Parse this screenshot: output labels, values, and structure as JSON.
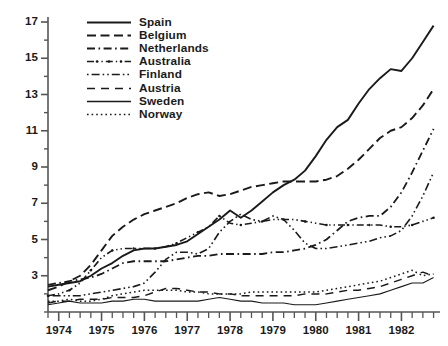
{
  "chart_data": {
    "type": "line",
    "title": "",
    "xlabel": "",
    "ylabel": "",
    "xlim": [
      1973.75,
      1982.9
    ],
    "ylim": [
      1,
      17
    ],
    "yticks_major": [
      3,
      5,
      7,
      9,
      11,
      13,
      15,
      17
    ],
    "yticks_minor": [
      1,
      2,
      4,
      6,
      8,
      10,
      12,
      14,
      16
    ],
    "xticks_major": [
      1974,
      1975,
      1976,
      1977,
      1978,
      1979,
      1980,
      1981,
      1982
    ],
    "xtick_labels": [
      "1974",
      "1975",
      "1976",
      "1977",
      "1978",
      "1979",
      "1980",
      "1981",
      "1982"
    ],
    "xtick_minor_step": 0.25,
    "grid": false,
    "legend_position": "top-left",
    "x": [
      1973.75,
      1974.0,
      1974.25,
      1974.5,
      1974.75,
      1975.0,
      1975.25,
      1975.5,
      1975.75,
      1976.0,
      1976.25,
      1976.5,
      1976.75,
      1977.0,
      1977.25,
      1977.5,
      1977.75,
      1978.0,
      1978.25,
      1978.5,
      1978.75,
      1979.0,
      1979.25,
      1979.5,
      1979.75,
      1980.0,
      1980.25,
      1980.5,
      1980.75,
      1981.0,
      1981.25,
      1981.5,
      1981.75,
      1982.0,
      1982.25,
      1982.5,
      1982.75
    ],
    "series": [
      {
        "name": "Spain",
        "style": "solid",
        "width": 1.9,
        "markers": false,
        "values": [
          2.4,
          2.5,
          2.6,
          2.7,
          3.0,
          3.4,
          3.7,
          4.1,
          4.4,
          4.5,
          4.5,
          4.6,
          4.7,
          4.9,
          5.3,
          5.7,
          6.1,
          6.6,
          6.2,
          6.6,
          7.1,
          7.6,
          8.0,
          8.3,
          8.8,
          9.6,
          10.5,
          11.2,
          11.6,
          12.5,
          13.3,
          13.9,
          14.4,
          14.3,
          15.0,
          15.9,
          16.8
        ]
      },
      {
        "name": "Belgium",
        "style": "dashed",
        "width": 1.9,
        "markers": false,
        "values": [
          2.2,
          2.4,
          2.7,
          3.0,
          3.6,
          4.4,
          5.2,
          5.7,
          6.1,
          6.4,
          6.6,
          6.8,
          7.0,
          7.3,
          7.5,
          7.6,
          7.4,
          7.5,
          7.7,
          7.9,
          8.0,
          8.1,
          8.2,
          8.2,
          8.2,
          8.2,
          8.3,
          8.5,
          8.9,
          9.4,
          10.0,
          10.6,
          11.0,
          11.2,
          11.7,
          12.4,
          13.3
        ]
      },
      {
        "name": "Netherlands",
        "style": "dashdot",
        "width": 1.8,
        "markers": false,
        "values": [
          2.5,
          2.6,
          2.7,
          2.8,
          2.9,
          3.1,
          3.4,
          3.7,
          3.8,
          3.8,
          3.8,
          3.8,
          3.9,
          4.0,
          4.1,
          4.1,
          4.2,
          4.2,
          4.2,
          4.2,
          4.2,
          4.3,
          4.3,
          4.4,
          4.5,
          4.7,
          5.0,
          5.5,
          6.0,
          6.2,
          6.3,
          6.3,
          6.8,
          7.6,
          8.7,
          9.9,
          11.1
        ]
      },
      {
        "name": "Australia",
        "style": "dashdotdot",
        "width": 1.6,
        "markers": true,
        "values": [
          1.9,
          2.0,
          2.2,
          2.6,
          3.3,
          4.0,
          4.4,
          4.5,
          4.5,
          4.5,
          4.5,
          4.6,
          4.8,
          5.1,
          5.4,
          5.7,
          6.3,
          5.9,
          5.8,
          5.9,
          6.0,
          6.1,
          6.1,
          6.1,
          6.0,
          5.9,
          5.8,
          5.8,
          5.8,
          5.8,
          5.8,
          5.8,
          5.7,
          5.7,
          5.8,
          6.0,
          6.2
        ]
      },
      {
        "name": "Finland",
        "style": "dotdash",
        "width": 1.6,
        "markers": false,
        "values": [
          1.9,
          1.9,
          1.9,
          1.9,
          2.0,
          2.1,
          2.2,
          2.3,
          2.4,
          2.6,
          3.2,
          3.9,
          4.3,
          4.3,
          4.2,
          4.5,
          5.4,
          6.0,
          6.4,
          6.1,
          6.0,
          6.3,
          6.1,
          5.5,
          4.8,
          4.5,
          4.5,
          4.6,
          4.7,
          4.8,
          4.9,
          5.1,
          5.2,
          5.5,
          6.3,
          7.4,
          8.7
        ]
      },
      {
        "name": "Austria",
        "style": "longdash",
        "width": 1.5,
        "markers": false,
        "values": [
          1.5,
          1.6,
          1.6,
          1.7,
          1.7,
          1.7,
          1.8,
          1.8,
          1.8,
          1.9,
          2.1,
          2.3,
          2.3,
          2.2,
          2.1,
          2.1,
          2.0,
          2.0,
          1.9,
          1.9,
          1.9,
          1.9,
          1.9,
          1.9,
          2.0,
          2.0,
          2.0,
          2.1,
          2.2,
          2.2,
          2.3,
          2.4,
          2.6,
          2.8,
          3.0,
          3.2,
          3.0
        ]
      },
      {
        "name": "Sweden",
        "style": "solid",
        "width": 1.1,
        "markers": false,
        "values": [
          1.4,
          1.5,
          1.6,
          1.5,
          1.5,
          1.5,
          1.6,
          1.6,
          1.7,
          1.7,
          1.6,
          1.6,
          1.6,
          1.6,
          1.6,
          1.7,
          1.8,
          1.7,
          1.6,
          1.6,
          1.5,
          1.5,
          1.5,
          1.4,
          1.4,
          1.4,
          1.5,
          1.6,
          1.7,
          1.8,
          1.9,
          2.0,
          2.2,
          2.4,
          2.6,
          2.6,
          2.9
        ]
      },
      {
        "name": "Norway",
        "style": "dotted",
        "width": 1.5,
        "markers": false,
        "values": [
          1.6,
          1.6,
          1.7,
          1.6,
          1.6,
          1.7,
          1.9,
          2.0,
          2.1,
          2.2,
          2.2,
          2.2,
          2.2,
          2.1,
          2.1,
          2.0,
          2.0,
          2.0,
          2.0,
          2.1,
          2.1,
          2.1,
          2.1,
          2.1,
          2.1,
          2.1,
          2.2,
          2.3,
          2.4,
          2.5,
          2.6,
          2.7,
          2.9,
          3.1,
          3.3,
          3.0,
          3.1
        ]
      }
    ]
  },
  "legend": {
    "items": [
      {
        "label": "Spain"
      },
      {
        "label": "Belgium"
      },
      {
        "label": "Netherlands"
      },
      {
        "label": "Australia"
      },
      {
        "label": "Finland"
      },
      {
        "label": "Austria"
      },
      {
        "label": "Sweden"
      },
      {
        "label": "Norway"
      }
    ]
  },
  "axes": {
    "y_labels": [
      "17",
      "15",
      "13",
      "11",
      "9",
      "7",
      "5",
      "3"
    ],
    "x_labels": [
      "1974",
      "1975",
      "1976",
      "1977",
      "1978",
      "1979",
      "1980",
      "1981",
      "1982"
    ]
  },
  "colors": {
    "ink": "#1a1a1a",
    "axis": "#555555",
    "background": "#ffffff"
  }
}
